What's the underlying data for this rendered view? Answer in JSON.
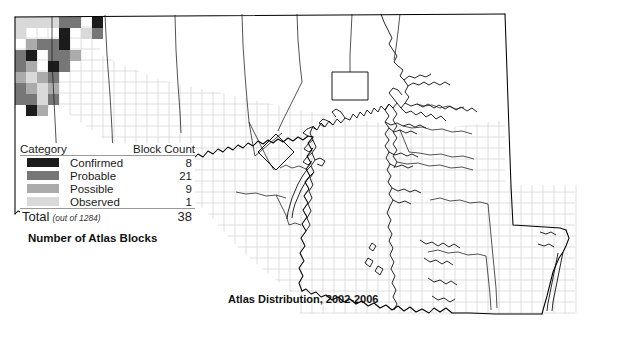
{
  "figure": {
    "map_caption": "Atlas Distribution, 2002-2006",
    "legend_caption": "Number of Atlas Blocks"
  },
  "legend": {
    "header": {
      "category": "Category",
      "block_count": "Block Count"
    },
    "rows": [
      {
        "label": "Confirmed",
        "count": "8",
        "color": "#1c1c1c"
      },
      {
        "label": "Probable",
        "count": "21",
        "color": "#777777"
      },
      {
        "label": "Possible",
        "count": "9",
        "color": "#ababab"
      },
      {
        "label": "Observed",
        "count": "1",
        "color": "#d9d9d9"
      }
    ],
    "total": {
      "label": "Total",
      "note": "(out of 1284)",
      "count": "38"
    }
  },
  "map": {
    "state_outline_color": "#000000",
    "county_line_color": "#1a1a1a",
    "grid_color": "#d5d5d5",
    "background": "#ffffff",
    "shaded_blocks": [
      {
        "x": 15,
        "y": 17,
        "shade": "#d9d9d9"
      },
      {
        "x": 26,
        "y": 17,
        "shade": "#d9d9d9"
      },
      {
        "x": 37,
        "y": 17,
        "shade": "#d9d9d9"
      },
      {
        "x": 48,
        "y": 17,
        "shade": "#d9d9d9"
      },
      {
        "x": 59,
        "y": 17,
        "shade": "#777777"
      },
      {
        "x": 70,
        "y": 17,
        "shade": "#777777"
      },
      {
        "x": 92,
        "y": 17,
        "shade": "#1c1c1c"
      },
      {
        "x": 15,
        "y": 28,
        "shade": "#d9d9d9"
      },
      {
        "x": 59,
        "y": 28,
        "shade": "#1c1c1c"
      },
      {
        "x": 81,
        "y": 28,
        "shade": "#d9d9d9"
      },
      {
        "x": 92,
        "y": 28,
        "shade": "#777777"
      },
      {
        "x": 26,
        "y": 39,
        "shade": "#ababab"
      },
      {
        "x": 37,
        "y": 39,
        "shade": "#777777"
      },
      {
        "x": 48,
        "y": 39,
        "shade": "#777777"
      },
      {
        "x": 59,
        "y": 39,
        "shade": "#1c1c1c"
      },
      {
        "x": 15,
        "y": 50,
        "shade": "#777777"
      },
      {
        "x": 26,
        "y": 50,
        "shade": "#1c1c1c"
      },
      {
        "x": 48,
        "y": 50,
        "shade": "#777777"
      },
      {
        "x": 59,
        "y": 50,
        "shade": "#777777"
      },
      {
        "x": 70,
        "y": 50,
        "shade": "#ababab"
      },
      {
        "x": 15,
        "y": 61,
        "shade": "#777777"
      },
      {
        "x": 26,
        "y": 61,
        "shade": "#ababab"
      },
      {
        "x": 48,
        "y": 61,
        "shade": "#1c1c1c"
      },
      {
        "x": 59,
        "y": 61,
        "shade": "#777777"
      },
      {
        "x": 15,
        "y": 72,
        "shade": "#ababab"
      },
      {
        "x": 26,
        "y": 72,
        "shade": "#d9d9d9"
      },
      {
        "x": 37,
        "y": 72,
        "shade": "#ababab"
      },
      {
        "x": 48,
        "y": 72,
        "shade": "#777777"
      },
      {
        "x": 15,
        "y": 83,
        "shade": "#777777"
      },
      {
        "x": 26,
        "y": 83,
        "shade": "#ababab"
      },
      {
        "x": 37,
        "y": 83,
        "shade": "#d9d9d9"
      },
      {
        "x": 48,
        "y": 83,
        "shade": "#ababab"
      },
      {
        "x": 15,
        "y": 94,
        "shade": "#777777"
      },
      {
        "x": 26,
        "y": 94,
        "shade": "#777777"
      },
      {
        "x": 37,
        "y": 94,
        "shade": "#d9d9d9"
      },
      {
        "x": 48,
        "y": 94,
        "shade": "#777777"
      },
      {
        "x": 26,
        "y": 105,
        "shade": "#1c1c1c"
      },
      {
        "x": 37,
        "y": 105,
        "shade": "#ababab"
      }
    ]
  }
}
